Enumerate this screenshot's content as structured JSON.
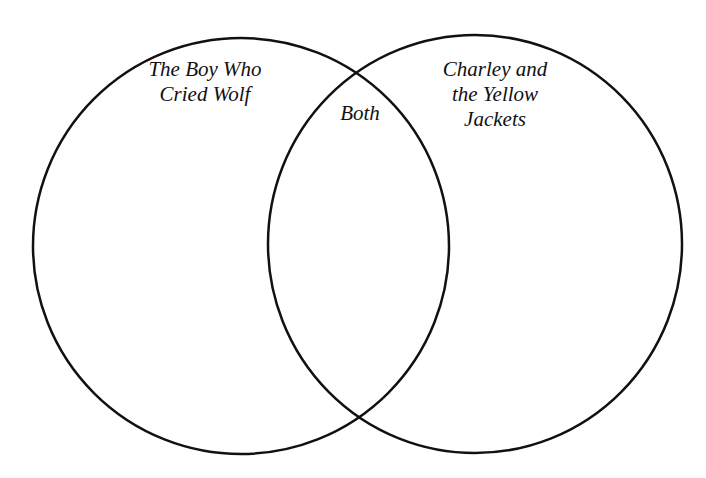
{
  "diagram": {
    "type": "venn",
    "stroke_color": "#111111",
    "background": "#ffffff",
    "sets": [
      {
        "label": "The Boy Who\nCried Wolf",
        "cx": 241,
        "cy": 246,
        "rx": 208,
        "ry": 208
      },
      {
        "label": "Charley and\nthe Yellow\nJackets",
        "cx": 475,
        "cy": 244,
        "rx": 207,
        "ry": 209
      }
    ],
    "intersection_label": "Both"
  }
}
